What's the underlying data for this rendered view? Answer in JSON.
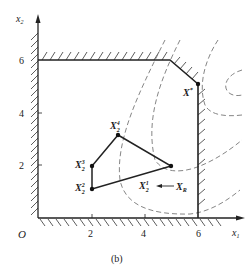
{
  "figure": {
    "caption": "(b)",
    "origin_label": "O",
    "x_axis": {
      "label": "x",
      "label_sub": "1",
      "ticks": [
        "2",
        "4",
        "6"
      ]
    },
    "y_axis": {
      "label": "x",
      "label_sub": "2",
      "ticks": [
        "2",
        "4",
        "6"
      ]
    },
    "points": {
      "optimum": {
        "base": "X",
        "sup": "*"
      },
      "p4": {
        "base": "X",
        "sub": "2",
        "sup": "4"
      },
      "p3": {
        "base": "X",
        "sub": "2",
        "sup": "3"
      },
      "p2": {
        "base": "X",
        "sub": "2",
        "sup": "2"
      },
      "p1": {
        "base": "X",
        "sub": "2",
        "sup": "1"
      },
      "reflect": {
        "base": "X",
        "sub": "R"
      }
    },
    "colors": {
      "line": "#222222",
      "contour": "#777777",
      "hatch": "#333333"
    }
  }
}
